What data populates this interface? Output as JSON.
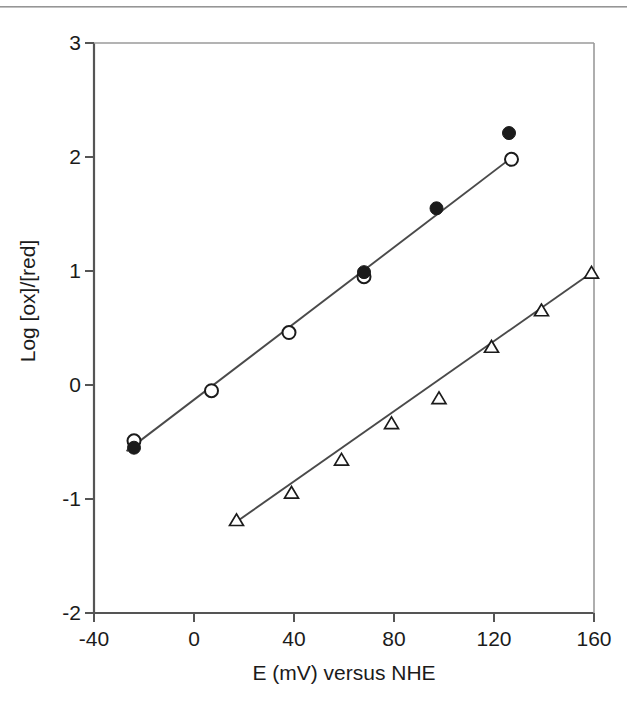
{
  "figure": {
    "background_color": "#ffffff",
    "axis_color": "#555555",
    "marker_color": "#1b1b1b",
    "line_color": "#4a4a4a",
    "scanline_artifact": true
  },
  "chart_data": {
    "type": "scatter",
    "title": "",
    "xlabel": "E (mV) versus NHE",
    "ylabel": "Log [ox]/[red]",
    "xlim": [
      -40,
      160
    ],
    "ylim": [
      -2,
      3
    ],
    "xticks": [
      -40,
      0,
      40,
      80,
      120,
      160
    ],
    "xtick_labels": [
      "-40",
      "0",
      "40",
      "80",
      "120",
      "160"
    ],
    "yticks": [
      -2,
      -1,
      0,
      1,
      2,
      3
    ],
    "ytick_labels": [
      "-2",
      "-1",
      "0",
      "1",
      "2",
      "3"
    ],
    "grid": false,
    "legend": "none",
    "series": [
      {
        "name": "filled-circle-series",
        "marker": "filled-circle",
        "marker_size": 13,
        "fitted_line": true,
        "x": [
          -24,
          68,
          97,
          126
        ],
        "y": [
          -0.55,
          0.99,
          1.55,
          2.21
        ]
      },
      {
        "name": "open-circle-series",
        "marker": "open-circle",
        "marker_size": 13,
        "fitted_line": true,
        "x": [
          -24,
          7,
          38,
          68,
          127
        ],
        "y": [
          -0.49,
          -0.05,
          0.46,
          0.95,
          1.98
        ]
      },
      {
        "name": "open-triangle-series",
        "marker": "open-triangle",
        "marker_size": 12,
        "fitted_line": true,
        "x": [
          17,
          39,
          59,
          79,
          98,
          119,
          139,
          159
        ],
        "y": [
          -1.19,
          -0.95,
          -0.66,
          -0.34,
          -0.12,
          0.33,
          0.65,
          0.98
        ]
      }
    ],
    "fit_lines": [
      {
        "name": "upper-fit-line",
        "x_start": -27,
        "y_start": -0.58,
        "x_end": 128,
        "y_end": 2.01
      },
      {
        "name": "lower-fit-line",
        "x_start": 15,
        "y_start": -1.23,
        "x_end": 160,
        "y_end": 1.0
      }
    ]
  }
}
